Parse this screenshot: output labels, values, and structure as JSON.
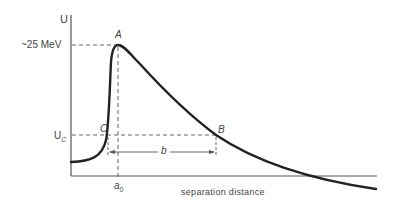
{
  "diagram": {
    "y_axis_label": "U",
    "x_axis_label": "separation distance",
    "peak_value_label": "~25 MeV",
    "coulomb_level_label": "U",
    "coulomb_level_subscript": "C",
    "point_a": "A",
    "point_b": "B",
    "point_c": "C",
    "distance_label": "b",
    "radius_label": "a",
    "radius_subscript": "0"
  }
}
